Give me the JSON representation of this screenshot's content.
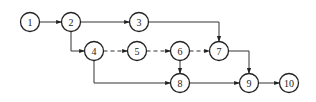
{
  "diagram": {
    "type": "network-diagram",
    "node_radius": 9.5,
    "nodes": [
      {
        "id": "1",
        "label": "1",
        "x": 30,
        "y": 22
      },
      {
        "id": "2",
        "label": "2",
        "x": 71,
        "y": 22
      },
      {
        "id": "3",
        "label": "3",
        "x": 139,
        "y": 22
      },
      {
        "id": "4",
        "label": "4",
        "x": 94,
        "y": 51
      },
      {
        "id": "5",
        "label": "5",
        "x": 137,
        "y": 51
      },
      {
        "id": "6",
        "label": "6",
        "x": 180,
        "y": 51
      },
      {
        "id": "7",
        "label": "7",
        "x": 219,
        "y": 51
      },
      {
        "id": "8",
        "label": "8",
        "x": 180,
        "y": 83
      },
      {
        "id": "9",
        "label": "9",
        "x": 249,
        "y": 83
      },
      {
        "id": "10",
        "label": "10",
        "x": 289,
        "y": 83
      }
    ],
    "edges": [
      {
        "from": "1",
        "to": "2",
        "style": "solid",
        "path": "M39.5,22 L61.5,22"
      },
      {
        "from": "2",
        "to": "3",
        "style": "solid",
        "path": "M80.5,22 L129.5,22"
      },
      {
        "from": "2",
        "to": "4",
        "style": "solid",
        "path": "M71,31.5 L71,51 L84.5,51"
      },
      {
        "from": "3",
        "to": "7",
        "style": "solid",
        "path": "M148.5,22 L219,22 L219,41.5"
      },
      {
        "from": "4",
        "to": "5",
        "style": "dashed",
        "path": "M103.5,51 L127.5,51"
      },
      {
        "from": "5",
        "to": "6",
        "style": "dashed",
        "path": "M146.5,51 L170.5,51"
      },
      {
        "from": "6",
        "to": "7",
        "style": "dashed",
        "path": "M189.5,51 L209.5,51"
      },
      {
        "from": "6",
        "to": "8",
        "style": "solid",
        "path": "M180,60.5 L180,73.5"
      },
      {
        "from": "4",
        "to": "8",
        "style": "solid",
        "path": "M94,60.5 L94,83 L170.5,83"
      },
      {
        "from": "7",
        "to": "9",
        "style": "solid",
        "path": "M228.5,51 L249,51 L249,73.5"
      },
      {
        "from": "8",
        "to": "9",
        "style": "solid",
        "path": "M189.5,83 L239.5,83"
      },
      {
        "from": "9",
        "to": "10",
        "style": "solid",
        "path": "M258.5,83 L279.5,83"
      }
    ]
  }
}
